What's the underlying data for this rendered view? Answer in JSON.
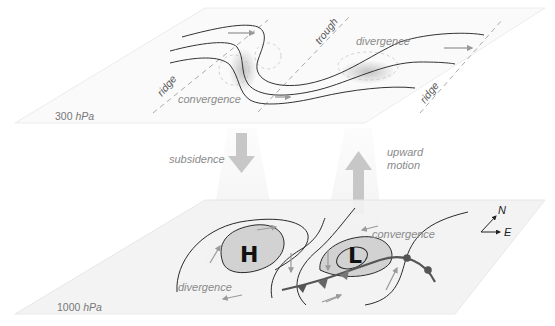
{
  "diagram": {
    "upper_level": {
      "pressure_label_num": "300",
      "pressure_label_unit": "hPa",
      "features": {
        "ridge_left": "ridge",
        "trough": "trough",
        "ridge_right": "ridge",
        "convergence": "convergence",
        "divergence": "divergence"
      }
    },
    "vertical_motion": {
      "subsidence": "subsidence",
      "upward_line1": "upward",
      "upward_line2": "motion"
    },
    "surface_level": {
      "pressure_label_num": "1000",
      "pressure_label_unit": "hPa",
      "high": "H",
      "low": "L",
      "divergence": "divergence",
      "convergence": "convergence"
    },
    "compass": {
      "north": "N",
      "east": "E"
    },
    "colors": {
      "plane_fill": "#f4f4f4",
      "plane_edge": "#e4e4e4",
      "isobar": "#2a2a2a",
      "flow_arrow": "#9a9a9a",
      "label": "#8a8a8a",
      "shaded_pressure": "#d6d6d6",
      "vertical_arrow": "#c9c9c9",
      "front": "#555555"
    }
  }
}
